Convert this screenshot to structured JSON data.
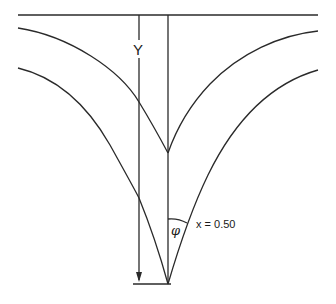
{
  "diagram": {
    "title": "",
    "labels": {
      "depth": "Y",
      "angle": "φ",
      "parameter": "x = 0.50"
    },
    "elements": {
      "surface_line": "top horizontal surface line",
      "center_axis": "vertical symmetry axis",
      "depth_arrow": "downward arrow indicating depth Y",
      "upper_curves": "pair of concave curves meeting at upper cusp",
      "lower_curves": "pair of concave curves meeting at lower cusp",
      "bottom_line": "short horizontal base line",
      "angle_arc": "arc marking half-angle φ at lower cusp"
    },
    "colors": {
      "line": "#2a2a2a",
      "background": "#ffffff"
    }
  }
}
